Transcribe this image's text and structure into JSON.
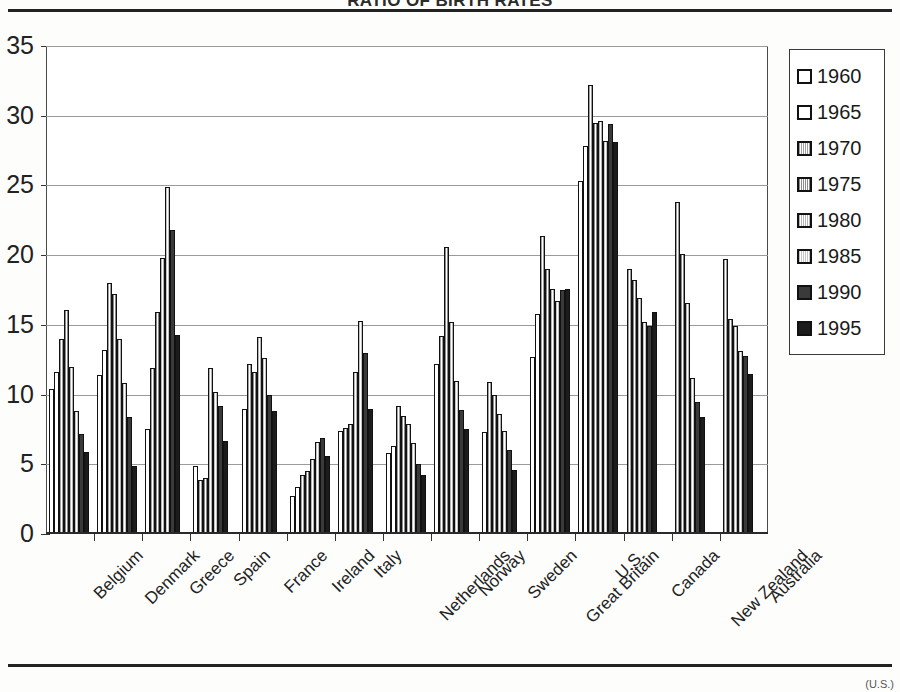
{
  "page": {
    "title_clipped": "RATIO OF BIRTH RATES",
    "corner_note": "(U.S.)"
  },
  "legend": {
    "position": "right",
    "items": [
      {
        "label": "1960",
        "swatch": "white"
      },
      {
        "label": "1965",
        "swatch": "white"
      },
      {
        "label": "1970",
        "swatch": "hatch-medium"
      },
      {
        "label": "1975",
        "swatch": "hatch-dark"
      },
      {
        "label": "1980",
        "swatch": "hatch-light"
      },
      {
        "label": "1985",
        "swatch": "hatch-lighter"
      },
      {
        "label": "1990",
        "swatch": "dark-gray"
      },
      {
        "label": "1995",
        "swatch": "black"
      }
    ]
  },
  "chart_data": {
    "type": "bar",
    "title": "RATIO OF BIRTH RATES",
    "xlabel": "",
    "ylabel": "",
    "ylim": [
      0,
      35
    ],
    "yticks": [
      0,
      5,
      10,
      15,
      20,
      25,
      30,
      35
    ],
    "grid": true,
    "legend_position": "right",
    "categories": [
      "Belgium",
      "Denmark",
      "Greece",
      "Spain",
      "France",
      "Ireland",
      "Italy",
      "Netherlands",
      "Norway",
      "Sweden",
      "Great Britain",
      "U.S.",
      "Canada",
      "New Zealand",
      "Australia"
    ],
    "series": [
      {
        "name": "1960",
        "values": [
          10.4,
          11.4,
          null,
          null,
          null,
          2.7,
          null,
          5.8,
          null,
          null,
          12.7,
          25.3,
          null,
          null,
          null
        ]
      },
      {
        "name": "1965",
        "values": [
          11.6,
          13.2,
          7.5,
          4.9,
          9.0,
          3.4,
          7.4,
          6.3,
          12.2,
          7.3,
          15.8,
          27.8,
          null,
          null,
          null
        ]
      },
      {
        "name": "1970",
        "values": [
          14.0,
          18.0,
          11.9,
          3.9,
          12.2,
          4.2,
          7.6,
          9.2,
          14.2,
          10.9,
          21.4,
          32.2,
          19.0,
          23.8,
          19.7
        ]
      },
      {
        "name": "1975",
        "values": [
          16.1,
          17.2,
          15.9,
          4.0,
          11.6,
          4.5,
          7.9,
          8.5,
          20.6,
          10.0,
          19.0,
          29.5,
          18.2,
          20.1,
          15.4
        ]
      },
      {
        "name": "1980",
        "values": [
          12.0,
          14.0,
          19.8,
          11.9,
          14.1,
          5.4,
          11.6,
          7.9,
          15.2,
          8.6,
          17.6,
          29.6,
          16.9,
          16.6,
          14.9
        ]
      },
      {
        "name": "1985",
        "values": [
          8.8,
          10.8,
          24.9,
          10.2,
          12.6,
          6.6,
          15.3,
          6.5,
          11.0,
          7.4,
          16.7,
          28.2,
          15.2,
          11.2,
          13.1
        ]
      },
      {
        "name": "1990",
        "values": [
          7.2,
          8.4,
          21.8,
          9.2,
          10.0,
          6.9,
          13.0,
          5.0,
          8.9,
          6.0,
          17.5,
          29.4,
          14.9,
          9.5,
          12.8
        ]
      },
      {
        "name": "1995",
        "values": [
          5.9,
          4.9,
          14.3,
          6.7,
          8.8,
          5.6,
          9.0,
          4.2,
          7.5,
          4.6,
          17.6,
          28.1,
          15.9,
          8.4,
          11.5
        ]
      }
    ]
  }
}
